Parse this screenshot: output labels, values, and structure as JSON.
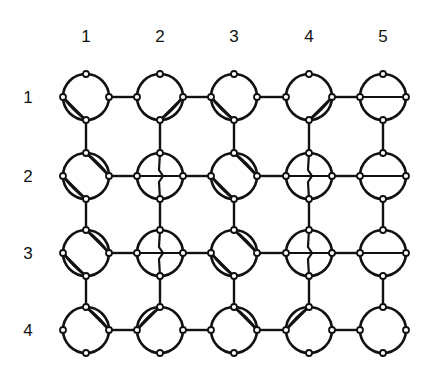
{
  "column_labels": [
    "1",
    "2",
    "3",
    "4",
    "5"
  ],
  "row_labels": [
    "1",
    "2",
    "3",
    "4"
  ],
  "layout": {
    "col_x": [
      86,
      160,
      234,
      309,
      383
    ],
    "row_y": [
      97,
      176,
      253,
      330
    ],
    "ring_radius": 23,
    "node_radius": 3,
    "col_label_y": 36,
    "row_label_x": 28
  },
  "colors": {
    "stroke": "#111111",
    "background": "#ffffff"
  },
  "cells": [
    [
      {
        "chords": [
          "left-bottom"
        ]
      },
      {
        "chords": [
          "right-bottom"
        ]
      },
      {
        "chords": [
          "left-bottom"
        ]
      },
      {
        "chords": [
          "right-bottom"
        ]
      },
      {
        "chords": [
          "left-right"
        ]
      }
    ],
    [
      {
        "chords": [
          "top-right",
          "left-bottom"
        ]
      },
      {
        "chords": [
          "left-right",
          "top-bottom"
        ]
      },
      {
        "chords": [
          "top-right",
          "left-bottom"
        ]
      },
      {
        "chords": [
          "left-right",
          "top-bottom"
        ]
      },
      {
        "chords": [
          "left-right"
        ]
      }
    ],
    [
      {
        "chords": [
          "top-right",
          "left-bottom"
        ]
      },
      {
        "chords": [
          "left-right",
          "top-bottom"
        ]
      },
      {
        "chords": [
          "top-right",
          "left-bottom"
        ]
      },
      {
        "chords": [
          "left-right",
          "top-bottom"
        ]
      },
      {
        "chords": [
          "left-right"
        ]
      }
    ],
    [
      {
        "chords": [
          "top-right"
        ]
      },
      {
        "chords": [
          "top-left"
        ]
      },
      {
        "chords": [
          "top-right"
        ]
      },
      {
        "chords": [
          "top-left"
        ]
      },
      {
        "chords": []
      }
    ]
  ]
}
